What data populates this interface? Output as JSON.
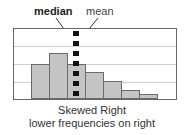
{
  "chart_data": {
    "type": "bar",
    "subtype": "histogram",
    "title": "Skewed Right",
    "subtitle": "lower frequencies on right",
    "xlabel": "",
    "ylabel": "",
    "categories": [
      "1",
      "2",
      "3",
      "4",
      "5",
      "6",
      "7"
    ],
    "values": [
      2,
      2.6,
      2,
      1.55,
      1,
      0.5,
      0.28
    ],
    "ylim": [
      0,
      4
    ],
    "grid": true,
    "annotations": [
      {
        "text": "median",
        "bold": true,
        "position": "bin 3"
      },
      {
        "text": "mean",
        "bold": false,
        "position": "bin 3"
      }
    ],
    "marker_line": {
      "style": "dashed",
      "color": "#111111",
      "x_bin": 3
    }
  },
  "labels": {
    "median": "median",
    "mean": "mean",
    "caption_title": "Skewed Right",
    "caption_subtitle": "lower frequencies on right"
  },
  "colors": {
    "bar_fill": "#c4c4c4",
    "bar_border": "#6a6a6a",
    "grid": "#cfcfcf",
    "frame": "#666666",
    "marker": "#111111"
  }
}
